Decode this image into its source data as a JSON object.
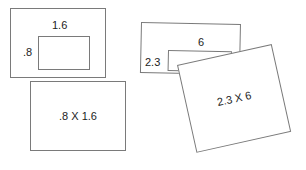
{
  "canvas": {
    "width": 306,
    "height": 170,
    "background": "#ffffff",
    "stroke_color": "#7a7a7a",
    "text_color": "#1c1c1c"
  },
  "diagram": {
    "title": "",
    "type": "area-model-multiplication-cards",
    "groups": [
      {
        "id": "group-1",
        "outer_card": {
          "x": 10,
          "y": 8,
          "width": 96,
          "height": 70
        },
        "inner_rect": {
          "x": 38,
          "y": 36,
          "width": 52,
          "height": 34
        },
        "top_label": "1.6",
        "side_label": ".8",
        "product_card": {
          "x": 30,
          "y": 81,
          "width": 96,
          "height": 70,
          "rotation": 0
        },
        "product_label": ".8 X 1.6"
      },
      {
        "id": "group-2",
        "outer_card": {
          "x": 141,
          "y": 22,
          "width": 100,
          "height": 51,
          "rotation": 1.2
        },
        "inner_rect": {
          "x": 168,
          "y": 50,
          "width": 64,
          "height": 21,
          "rotation": 1.2
        },
        "top_label": "6",
        "side_label": "2.3",
        "product_card": {
          "x": 177,
          "y": 65,
          "width": 97,
          "height": 90,
          "rotation": -12.5
        },
        "product_label": "2.3 X 6"
      }
    ]
  }
}
